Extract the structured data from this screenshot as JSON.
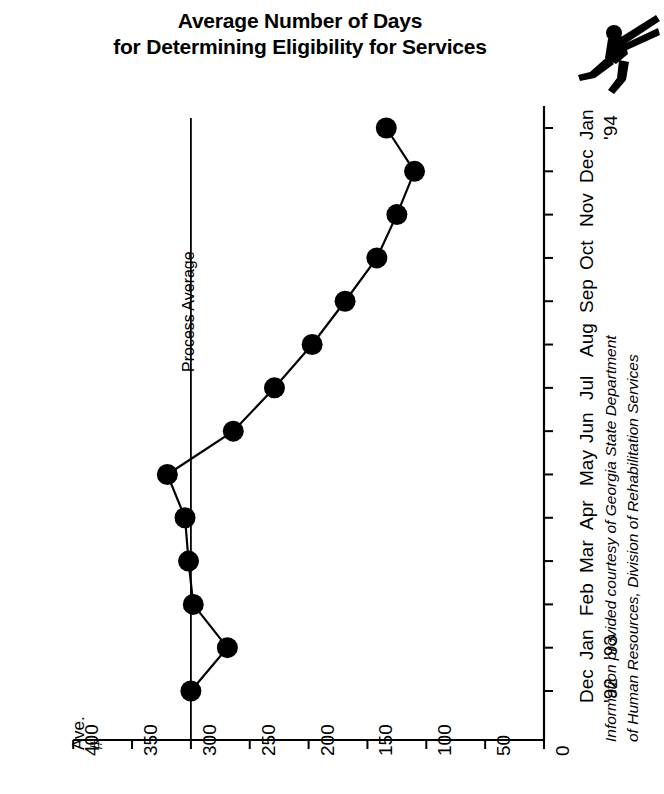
{
  "title": {
    "line1": "Average Number of Days",
    "line2": "for Determining Eligibility for Services"
  },
  "icon": {
    "runner": "running-person-icon"
  },
  "annotations": {
    "process_average_label": "Process Average",
    "value_axis_name_line1": "Ave.",
    "value_axis_name_line2": "#",
    "credit_line1": "Information provided courtesy of Georgia State Department",
    "credit_line2": "of Human Resources, Division of Rehabilitation Services"
  },
  "colors": {
    "ink": "#000000",
    "background": "#ffffff",
    "marker": "#000000",
    "line": "#000000"
  },
  "chart_data": {
    "type": "line",
    "title": "Average Number of Days for Determining Eligibility for Services",
    "orientation": "rotated-90",
    "xlabel": "",
    "ylabel": "Ave. #",
    "ylim": [
      0,
      400
    ],
    "yticks": [
      400,
      350,
      300,
      250,
      200,
      150,
      100,
      50,
      0
    ],
    "ytick_labels": [
      "400",
      "350",
      "300",
      "250",
      "200",
      "150",
      "100",
      "50",
      "0"
    ],
    "grid": false,
    "legend": false,
    "categories": [
      "Dec",
      "Jan",
      "Feb",
      "Mar",
      "Apr",
      "May",
      "Jun",
      "Jul",
      "Aug",
      "Sep",
      "Oct",
      "Nov",
      "Dec",
      "Jan"
    ],
    "category_years": [
      "'92",
      "'93",
      "",
      "",
      "",
      "",
      "",
      "",
      "",
      "",
      "",
      "",
      "",
      "'94"
    ],
    "values": [
      300,
      269,
      298,
      302,
      305,
      320,
      264,
      229,
      197,
      169,
      142,
      125,
      110,
      134
    ],
    "reference_line": {
      "label": "Process Average",
      "value": 300
    },
    "annotations": [
      "Information provided courtesy of Georgia State Department",
      "of Human Resources, Division of Rehabilitation Services"
    ]
  }
}
